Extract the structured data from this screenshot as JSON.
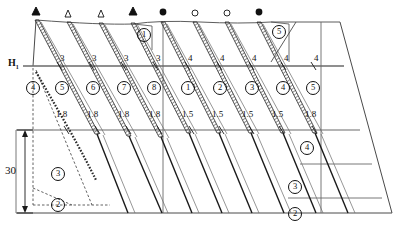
{
  "diagram": {
    "labels": {
      "crest_level": "H",
      "crest_level_sub": "1",
      "height_dimension": "30"
    },
    "top_markers": [
      {
        "id": "m1",
        "shape": "filled-triangle",
        "x": 36,
        "y": 11
      },
      {
        "id": "m2",
        "shape": "hollow-triangle",
        "x": 68,
        "y": 14
      },
      {
        "id": "m3",
        "shape": "hollow-triangle",
        "x": 101,
        "y": 14
      },
      {
        "id": "m4",
        "shape": "filled-triangle",
        "x": 133,
        "y": 11
      },
      {
        "id": "m5",
        "shape": "filled-circle",
        "x": 162,
        "y": 12
      },
      {
        "id": "m6",
        "shape": "hollow-circle",
        "x": 194,
        "y": 13
      },
      {
        "id": "m7",
        "shape": "hollow-circle",
        "x": 226,
        "y": 13
      },
      {
        "id": "m8",
        "shape": "filled-circle",
        "x": 258,
        "y": 12
      }
    ],
    "upper_tick_labels": [
      {
        "text": "3",
        "x": 61,
        "y": 59
      },
      {
        "text": "3",
        "x": 94,
        "y": 59
      },
      {
        "text": "3",
        "x": 126,
        "y": 59
      },
      {
        "text": "3",
        "x": 158,
        "y": 59
      },
      {
        "text": "4",
        "x": 190,
        "y": 58
      },
      {
        "text": "4",
        "x": 222,
        "y": 58
      },
      {
        "text": "4",
        "x": 254,
        "y": 58
      },
      {
        "text": "4",
        "x": 286,
        "y": 58
      },
      {
        "text": "4",
        "x": 316,
        "y": 58
      }
    ],
    "zone_numbers_upper": [
      {
        "text": "4",
        "x": 31,
        "y": 86
      },
      {
        "text": "5",
        "x": 60,
        "y": 86
      },
      {
        "text": "6",
        "x": 91,
        "y": 86
      },
      {
        "text": "7",
        "x": 122,
        "y": 86
      },
      {
        "text": "8",
        "x": 152,
        "y": 86
      },
      {
        "text": "1",
        "x": 186,
        "y": 86
      },
      {
        "text": "2",
        "x": 218,
        "y": 86
      },
      {
        "text": "3",
        "x": 250,
        "y": 86
      },
      {
        "text": "4",
        "x": 281,
        "y": 86
      },
      {
        "text": "5",
        "x": 311,
        "y": 86
      }
    ],
    "spacing_labels": [
      {
        "text": "1.8",
        "x": 62,
        "y": 115
      },
      {
        "text": "1.8",
        "x": 92,
        "y": 115
      },
      {
        "text": "1.8",
        "x": 123,
        "y": 115
      },
      {
        "text": "1.8",
        "x": 153,
        "y": 115
      },
      {
        "text": "1.5",
        "x": 188,
        "y": 115
      },
      {
        "text": "1.5",
        "x": 218,
        "y": 115
      },
      {
        "text": "1.5",
        "x": 248,
        "y": 115
      },
      {
        "text": "1.5",
        "x": 278,
        "y": 115
      },
      {
        "text": "1.8",
        "x": 310,
        "y": 115
      }
    ],
    "zone_numbers_lower": [
      {
        "text": "3",
        "x": 56,
        "y": 172
      },
      {
        "text": "2",
        "x": 56,
        "y": 203
      },
      {
        "text": "4",
        "x": 305,
        "y": 146
      },
      {
        "text": "3",
        "x": 293,
        "y": 185
      },
      {
        "text": "2",
        "x": 293,
        "y": 212
      }
    ],
    "callouts": [
      {
        "text": "1",
        "x": 142,
        "y": 33
      },
      {
        "text": "5",
        "x": 277,
        "y": 30
      }
    ],
    "colors": {
      "line": "#1a1a1a",
      "thin_line": "#5a5a5a",
      "hatch": "#2b2b2b",
      "dashed": "#3a3a3a",
      "background": "#ffffff"
    }
  }
}
